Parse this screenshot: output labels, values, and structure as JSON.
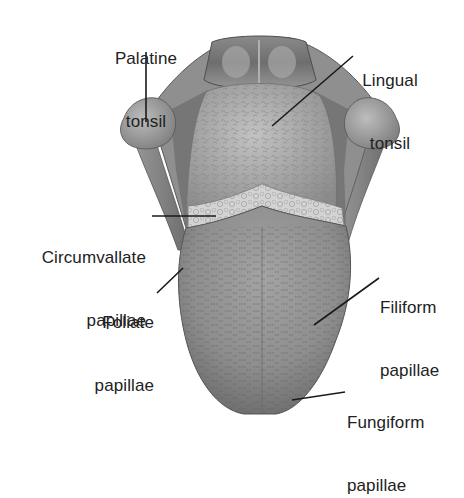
{
  "diagram": {
    "colors": {
      "background": "#ffffff",
      "tongue_body": "#8d8d8d",
      "tongue_highlight": "#b4b4b4",
      "tongue_dark": "#5e5e5e",
      "lingual_tonsil": "#a7a7a7",
      "circumvallate_band": "#d2d2d2",
      "palatine_tonsil": "#9c9c9c",
      "epiglottis": "#7a7a7a",
      "leader_line": "#1a1a1a",
      "text": "#222222"
    },
    "labels": [
      {
        "id": "palatine-tonsil",
        "lines": [
          "Palatine",
          "tonsil"
        ],
        "align": "center"
      },
      {
        "id": "lingual-tonsil",
        "lines": [
          "Lingual",
          "tonsil"
        ],
        "align": "center"
      },
      {
        "id": "circumvallate-papillae",
        "lines": [
          "Circumvallate",
          "papillae"
        ],
        "align": "right"
      },
      {
        "id": "foliate-papillae",
        "lines": [
          "Foliate",
          "papillae"
        ],
        "align": "right"
      },
      {
        "id": "filiform-papillae",
        "lines": [
          "Filiform",
          "papillae"
        ],
        "align": "left"
      },
      {
        "id": "fungiform-papillae",
        "lines": [
          "Fungiform",
          "papillae"
        ],
        "align": "left"
      }
    ]
  }
}
